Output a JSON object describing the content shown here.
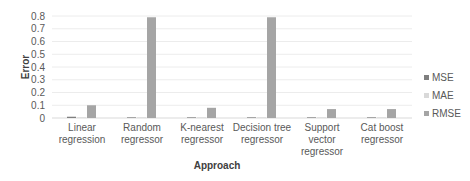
{
  "chart_data": {
    "type": "bar",
    "title": "",
    "xlabel": "Approach",
    "ylabel": "Error",
    "ylim": [
      0,
      0.8
    ],
    "yticks": [
      0,
      0.1,
      0.2,
      0.3,
      0.4,
      0.5,
      0.6,
      0.7,
      0.8
    ],
    "grid": true,
    "legend_position": "right",
    "categories": [
      [
        "Linear",
        "regression"
      ],
      [
        "Random",
        "regressor"
      ],
      [
        "K-nearest",
        "regressor"
      ],
      [
        "Decision tree",
        "regressor"
      ],
      [
        "Support",
        "vector",
        "regressor"
      ],
      [
        "Cat boost",
        "regressor"
      ]
    ],
    "series": [
      {
        "name": "MSE",
        "color": "#7f7f7f",
        "values": [
          0.01,
          0.005,
          0.005,
          0.005,
          0.005,
          0.005
        ]
      },
      {
        "name": "MAE",
        "color": "#d9d9d9",
        "values": [
          0.005,
          0.003,
          0.003,
          0.003,
          0.003,
          0.003
        ]
      },
      {
        "name": "RMSE",
        "color": "#a5a5a5",
        "values": [
          0.1,
          0.79,
          0.08,
          0.79,
          0.07,
          0.07
        ]
      }
    ]
  }
}
